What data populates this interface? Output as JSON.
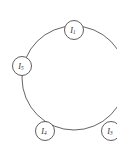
{
  "figure": {
    "type": "cycle-graph",
    "title": "",
    "background_color": "#ffffff",
    "stroke_color": "#555255",
    "node_fill_color": "#ffffff",
    "node_stroke_color": "#4e4b4e",
    "label_color": "#2e2b2e",
    "canvas": {
      "width": 117,
      "height": 159
    },
    "cycle": {
      "center_x": 74,
      "center_y": 78,
      "radius": 52
    },
    "nodes": [
      {
        "id": "node-top",
        "symbol": "I",
        "subscript": "1",
        "label": "I1",
        "cx": 74,
        "cy": 30,
        "r": 9.5,
        "position": "top"
      },
      {
        "id": "node-left",
        "symbol": "I",
        "subscript": "5",
        "label": "I5",
        "cx": 22,
        "cy": 66,
        "r": 9.5,
        "position": "left"
      },
      {
        "id": "node-bottom-left",
        "symbol": "I",
        "subscript": "4",
        "label": "I4",
        "cx": 45,
        "cy": 131,
        "r": 9.5,
        "position": "bottom-left"
      },
      {
        "id": "node-bottom-right",
        "symbol": "I",
        "subscript": "3",
        "label": "I3",
        "cx": 111,
        "cy": 131,
        "r": 9.5,
        "position": "bottom-right-clipped"
      }
    ]
  }
}
